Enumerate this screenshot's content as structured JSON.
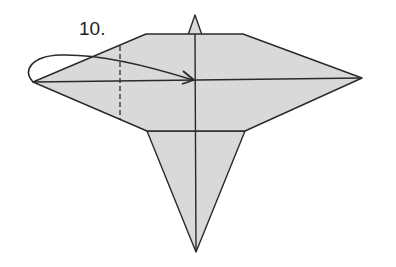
{
  "diagram": {
    "step_label": "10.",
    "colors": {
      "paper_fill": "#d9d9d9",
      "line": "#2a2a2a",
      "background": "#ffffff"
    },
    "elements": [
      {
        "name": "upper-body",
        "type": "polygon"
      },
      {
        "name": "lower-flap",
        "type": "triangle"
      },
      {
        "name": "top-tip",
        "type": "triangle"
      },
      {
        "name": "center-vertical-crease",
        "type": "line"
      },
      {
        "name": "horizontal-crease",
        "type": "line"
      },
      {
        "name": "valley-fold-dashed-line",
        "type": "dashed-line"
      },
      {
        "name": "fold-over-arrow",
        "type": "arrow"
      }
    ]
  }
}
